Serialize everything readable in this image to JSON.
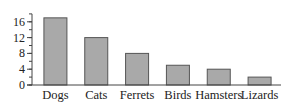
{
  "chart_data": {
    "type": "bar",
    "title": "",
    "xlabel": "",
    "ylabel": "",
    "categories": [
      "Dogs",
      "Cats",
      "Ferrets",
      "Birds",
      "Hamsters",
      "Lizards"
    ],
    "values": [
      17,
      12,
      8,
      5,
      4,
      2
    ],
    "ylim": [
      0,
      18
    ],
    "yticks": [
      0,
      4,
      8,
      12,
      16
    ],
    "minor_tick_step": 2,
    "grid": false,
    "legend": null,
    "bar_color": "#a9a9a9",
    "bar_edge_color": "#555555"
  }
}
